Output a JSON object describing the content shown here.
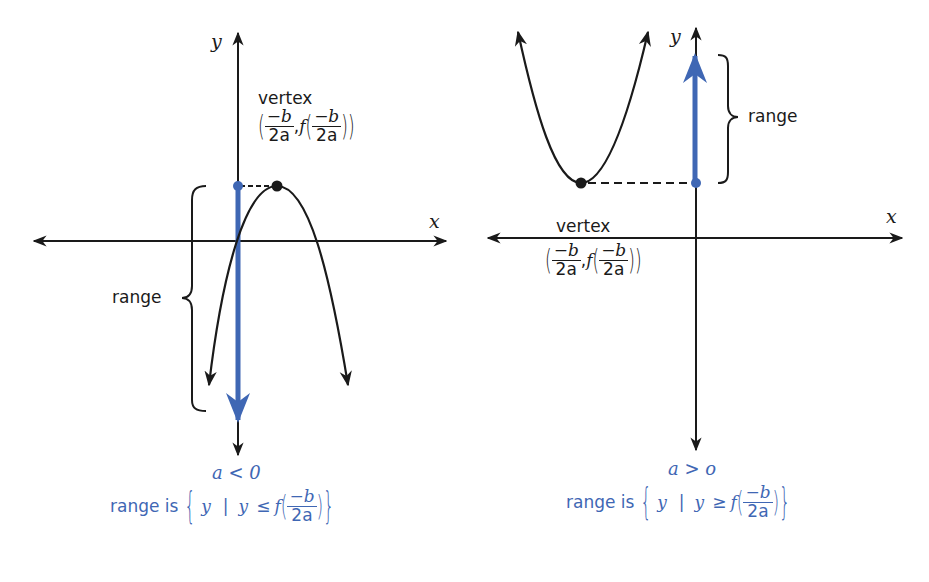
{
  "colors": {
    "ink": "#1a1a1a",
    "accent_blue": "#3f67b4",
    "background": "#ffffff"
  },
  "left_panel": {
    "x_axis_label": "x",
    "y_axis_label": "y",
    "vertex_label": "vertex",
    "vertex_coord": {
      "open": "(",
      "num": "−b",
      "den": "2a",
      "sep": ",",
      "f": "f",
      "close": ")"
    },
    "range_label": "range",
    "condition": "a < 0",
    "range_statement": {
      "prefix": "range is",
      "set_open": "{",
      "var": "y",
      "bar": "|",
      "inequality_lhs": "y",
      "relation": "≤",
      "f": "f",
      "num": "−b",
      "den": "2a",
      "set_close": "}"
    }
  },
  "right_panel": {
    "x_axis_label": "x",
    "y_axis_label": "y",
    "vertex_label": "vertex",
    "vertex_coord": {
      "open": "(",
      "num": "−b",
      "den": "2a",
      "sep": ",",
      "f": "f",
      "close": ")"
    },
    "range_label": "range",
    "condition": "a > o",
    "range_statement": {
      "prefix": "range is",
      "set_open": "{",
      "var": "y",
      "bar": "|",
      "inequality_lhs": "y",
      "relation": "≥",
      "f": "f",
      "num": "−b",
      "den": "2a",
      "set_close": "}"
    }
  }
}
